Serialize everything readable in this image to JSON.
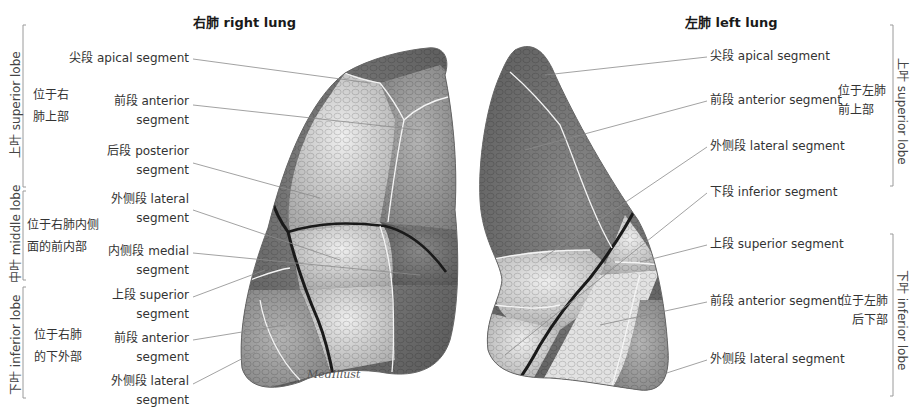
{
  "titles": {
    "right_lung": "右肺 right lung",
    "left_lung": "左肺 left lung"
  },
  "right_lung": {
    "lobes": [
      {
        "name": "上叶 superior lobe",
        "location": [
          "位于右",
          "肺上部"
        ]
      },
      {
        "name": "中叶 middle lobe",
        "location": [
          "位于右肺内侧",
          "面的前内部"
        ]
      },
      {
        "name": "下叶 inferior lobe",
        "location": [
          "位于右肺",
          "的下外部"
        ]
      }
    ],
    "segments": [
      {
        "line1": "尖段 apical segment",
        "line2": ""
      },
      {
        "line1": "前段 anterior",
        "line2": "segment"
      },
      {
        "line1": "后段 posterior",
        "line2": "segment"
      },
      {
        "line1": "外侧段 lateral",
        "line2": "segment"
      },
      {
        "line1": "内侧段 medial",
        "line2": "segment"
      },
      {
        "line1": "上段 superior",
        "line2": "segment"
      },
      {
        "line1": "前段 anterior",
        "line2": "segment"
      },
      {
        "line1": "外侧段 lateral",
        "line2": "segment"
      }
    ]
  },
  "left_lung": {
    "lobes": [
      {
        "name": "上叶 superior lobe",
        "location": [
          "位于左肺",
          "前上部"
        ]
      },
      {
        "name": "下叶 inferior lobe",
        "location": [
          "位于左肺",
          "后下部"
        ]
      }
    ],
    "segments": [
      "尖段 apical segment",
      "前段 anterior segment",
      "外侧段 lateral segment",
      "下段 inferior segment",
      "上段 superior segment",
      "前段 anterior segment",
      "外侧段 lateral segment"
    ]
  },
  "signature": "MedIllust",
  "colors": {
    "dark_lobe": "#6e6e6e",
    "mid_lobe": "#9a9a9a",
    "light_lobe": "#cfcfcf",
    "fissure": "#1a1a1a",
    "leader_line": "#8a8a8a",
    "bracket": "#9a9a9a"
  }
}
